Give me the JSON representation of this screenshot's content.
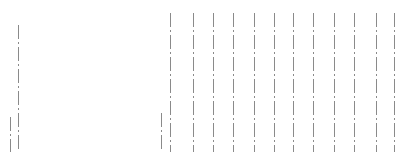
{
  "canvas": {
    "width": 411,
    "height": 166,
    "background": "#ffffff"
  },
  "line_color": "#8a8a8a",
  "dash_pattern": "dash-dot",
  "lines": [
    {
      "x": 10,
      "top": 117,
      "bottom": 152
    },
    {
      "x": 18,
      "top": 25,
      "bottom": 152
    },
    {
      "x": 161,
      "top": 113,
      "bottom": 152
    },
    {
      "x": 170,
      "top": 13,
      "bottom": 152
    },
    {
      "x": 193,
      "top": 13,
      "bottom": 152
    },
    {
      "x": 213,
      "top": 13,
      "bottom": 152
    },
    {
      "x": 233,
      "top": 13,
      "bottom": 152
    },
    {
      "x": 254,
      "top": 13,
      "bottom": 152
    },
    {
      "x": 274,
      "top": 13,
      "bottom": 152
    },
    {
      "x": 293,
      "top": 13,
      "bottom": 152
    },
    {
      "x": 313,
      "top": 13,
      "bottom": 152
    },
    {
      "x": 334,
      "top": 13,
      "bottom": 152
    },
    {
      "x": 354,
      "top": 13,
      "bottom": 152
    },
    {
      "x": 376,
      "top": 13,
      "bottom": 152
    },
    {
      "x": 394,
      "top": 13,
      "bottom": 152
    }
  ]
}
